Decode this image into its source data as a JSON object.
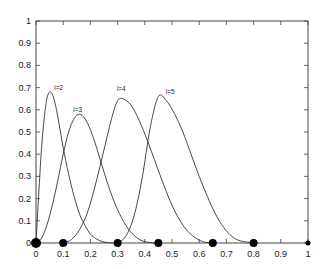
{
  "chart_data": {
    "type": "line",
    "title": "",
    "xlabel": "",
    "ylabel": "",
    "xlim": [
      0,
      1
    ],
    "ylim": [
      0,
      1
    ],
    "xticks": [
      "0",
      "0.1",
      "0.2",
      "0.3",
      "0.4",
      "0.5",
      "0.6",
      "0.7",
      "0.8",
      "0.9",
      "1"
    ],
    "yticks": [
      "0",
      "0.1",
      "0.2",
      "0.3",
      "0.4",
      "0.5",
      "0.6",
      "0.7",
      "0.8",
      "0.9",
      "1"
    ],
    "knots": [
      0,
      0.1,
      0.3,
      0.45,
      0.65,
      0.8,
      1.0
    ],
    "series": [
      {
        "name": "i=2",
        "x": [
          0,
          0.01,
          0.02,
          0.03,
          0.04,
          0.05,
          0.06,
          0.07,
          0.08,
          0.09,
          0.1,
          0.12,
          0.14,
          0.16,
          0.18,
          0.2,
          0.22,
          0.24,
          0.26,
          0.28,
          0.3
        ],
        "values": [
          0,
          0.22,
          0.42,
          0.56,
          0.65,
          0.68,
          0.67,
          0.63,
          0.57,
          0.5,
          0.43,
          0.31,
          0.21,
          0.13,
          0.08,
          0.04,
          0.02,
          0.008,
          0.002,
          0.0003,
          0
        ]
      },
      {
        "name": "i=3",
        "x": [
          0,
          0.02,
          0.04,
          0.06,
          0.08,
          0.1,
          0.12,
          0.14,
          0.16,
          0.18,
          0.2,
          0.22,
          0.24,
          0.26,
          0.28,
          0.3,
          0.33,
          0.36,
          0.39,
          0.42,
          0.45
        ],
        "values": [
          0,
          0.02,
          0.08,
          0.17,
          0.28,
          0.4,
          0.5,
          0.56,
          0.58,
          0.56,
          0.51,
          0.44,
          0.36,
          0.28,
          0.21,
          0.15,
          0.08,
          0.035,
          0.01,
          0.002,
          0
        ]
      },
      {
        "name": "i=4",
        "x": [
          0.1,
          0.13,
          0.16,
          0.19,
          0.22,
          0.25,
          0.28,
          0.3,
          0.32,
          0.35,
          0.38,
          0.41,
          0.44,
          0.47,
          0.5,
          0.53,
          0.56,
          0.59,
          0.62,
          0.65
        ],
        "values": [
          0,
          0.015,
          0.06,
          0.14,
          0.27,
          0.42,
          0.57,
          0.64,
          0.65,
          0.62,
          0.55,
          0.46,
          0.36,
          0.26,
          0.17,
          0.1,
          0.05,
          0.02,
          0.004,
          0
        ]
      },
      {
        "name": "i=5",
        "x": [
          0.3,
          0.33,
          0.36,
          0.39,
          0.42,
          0.45,
          0.48,
          0.51,
          0.54,
          0.57,
          0.6,
          0.63,
          0.66,
          0.69,
          0.72,
          0.75,
          0.8
        ],
        "values": [
          0,
          0.03,
          0.12,
          0.29,
          0.52,
          0.66,
          0.64,
          0.58,
          0.5,
          0.4,
          0.3,
          0.21,
          0.13,
          0.07,
          0.03,
          0.01,
          0
        ]
      }
    ],
    "labels": [
      {
        "text": "i=2",
        "x": 0.06,
        "y": 0.69
      },
      {
        "text": "i=3",
        "x": 0.13,
        "y": 0.59
      },
      {
        "text": "i=4",
        "x": 0.29,
        "y": 0.685
      },
      {
        "text": "i=5",
        "x": 0.47,
        "y": 0.67
      }
    ],
    "grid": false,
    "legend": "none"
  }
}
